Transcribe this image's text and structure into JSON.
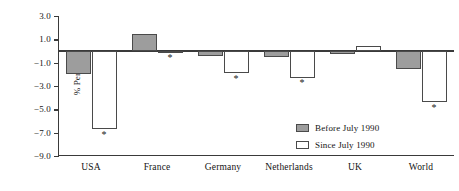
{
  "chart_data": {
    "type": "bar",
    "title": "",
    "xlabel": "",
    "ylabel": "% Per year",
    "categories": [
      "USA",
      "France",
      "Germany",
      "Netherlands",
      "UK",
      "World"
    ],
    "ylim": [
      -9.0,
      3.0
    ],
    "ytick_values": [
      3.0,
      1.0,
      -1.0,
      -3.0,
      -5.0,
      -7.0,
      -9.0
    ],
    "ytick_labels": [
      "3.0",
      "1.0",
      "−1.0",
      "−3.0",
      "−5.0",
      "−7.0",
      "−9.0"
    ],
    "grid": false,
    "legend_position": "bottom-right",
    "series": [
      {
        "name": "Before July 1990",
        "color": "#9d9d9d",
        "values": [
          -2.0,
          1.5,
          -0.4,
          -0.5,
          -0.25,
          -1.5
        ],
        "significance": [
          false,
          false,
          false,
          false,
          false,
          false
        ]
      },
      {
        "name": "Since July 1990",
        "color": "#ffffff",
        "values": [
          -6.7,
          -0.1,
          -1.9,
          -2.3,
          0.4,
          -4.4
        ],
        "significance": [
          true,
          true,
          true,
          true,
          false,
          true
        ]
      }
    ],
    "annotations": {
      "significance_marker": "*",
      "note": "Asterisk marks significant values on the Since July 1990 series"
    }
  },
  "legend": {
    "items": [
      {
        "label": "Before July 1990",
        "swatch": "before"
      },
      {
        "label": "Since July 1990",
        "swatch": "since"
      }
    ]
  }
}
